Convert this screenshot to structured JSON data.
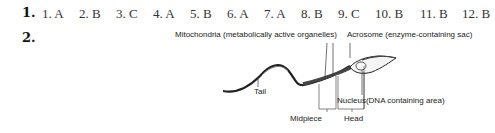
{
  "question1": {
    "number": "1.",
    "answers": [
      {
        "label": "1. A"
      },
      {
        "label": "2. B"
      },
      {
        "label": "3. C"
      },
      {
        "label": "4. A"
      },
      {
        "label": "5. B"
      },
      {
        "label": "6. A"
      },
      {
        "label": "7. A"
      },
      {
        "label": "8. B"
      },
      {
        "label": "9. C"
      },
      {
        "label": "10. B"
      },
      {
        "label": "11. B"
      },
      {
        "label": "12. B"
      }
    ]
  },
  "question2": {
    "number": "2.",
    "diagram": {
      "subject": "Sperm cell",
      "labels": {
        "mitochondria": "Mitochondria (metabolically active organelles)",
        "acrosome": "Acrosome (enzyme-containing sac)",
        "tail": "Tail",
        "nucleus": "Nucleus",
        "nucleus_desc": "(DNA containing area)",
        "midpiece": "Midpiece",
        "head": "Head"
      }
    }
  }
}
